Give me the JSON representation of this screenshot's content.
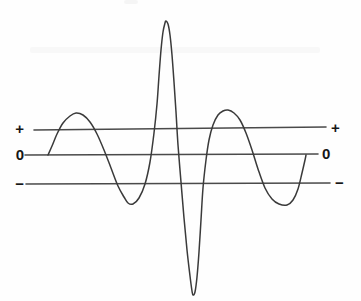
{
  "figure": {
    "background_color": "#fefefe",
    "curve_color": "#3a3a3a",
    "line_color": "#4a4a4a",
    "label_color": "#161616"
  },
  "labels": {
    "left": {
      "plus": "+",
      "zero": "0",
      "minus": "−"
    },
    "right": {
      "plus": "+",
      "zero": "0",
      "minus": "−"
    }
  },
  "reference_lines": [
    {
      "name": "plus-level-line",
      "label": "+",
      "x1": 34,
      "y1": 130,
      "x2": 326,
      "y2": 127
    },
    {
      "name": "zero-level-line",
      "label": "0",
      "x1": 25,
      "y1": 155,
      "x2": 318,
      "y2": 154
    },
    {
      "name": "minus-level-line",
      "label": "−",
      "x1": 26,
      "y1": 184,
      "x2": 330,
      "y2": 183
    }
  ],
  "chart_data": {
    "type": "line",
    "xlabel": "",
    "ylabel": "",
    "grid": false,
    "legend": null,
    "axis_levels": [
      "+",
      "0",
      "−"
    ],
    "level_y_pixels": {
      "plus": 128,
      "zero": 155,
      "minus": 183
    },
    "xlim": [
      48,
      306
    ],
    "ylim_pixels": [
      21,
      295
    ],
    "annotations": [
      "Curve begins at the zero level on the left at x=48",
      "Curve ends at the zero level on the right at x=306",
      "Central feature is a tall narrow positive spike immediately followed by a deep negative spike"
    ],
    "features": [
      {
        "name": "start",
        "x": 48,
        "y": 155,
        "level": "0"
      },
      {
        "name": "hump-1-peak",
        "x": 76,
        "y": 113,
        "level": "above +"
      },
      {
        "name": "trough-1-min",
        "x": 128,
        "y": 203,
        "level": "below −"
      },
      {
        "name": "spike-up-apex",
        "x": 166,
        "y": 21,
        "level": "far above +"
      },
      {
        "name": "spike-down-min",
        "x": 193,
        "y": 295,
        "level": "far below −"
      },
      {
        "name": "hump-2-peak",
        "x": 228,
        "y": 110,
        "level": "above +"
      },
      {
        "name": "trough-2-min",
        "x": 287,
        "y": 205,
        "level": "below −"
      },
      {
        "name": "end",
        "x": 306,
        "y": 155,
        "level": "0"
      }
    ],
    "points": [
      [
        48,
        155
      ],
      [
        52,
        146
      ],
      [
        57,
        134
      ],
      [
        63,
        123
      ],
      [
        70,
        116
      ],
      [
        76,
        113
      ],
      [
        83,
        115
      ],
      [
        90,
        122
      ],
      [
        97,
        134
      ],
      [
        104,
        150
      ],
      [
        111,
        168
      ],
      [
        118,
        186
      ],
      [
        124,
        197
      ],
      [
        128,
        203
      ],
      [
        133,
        204
      ],
      [
        139,
        198
      ],
      [
        145,
        184
      ],
      [
        150,
        162
      ],
      [
        154,
        133
      ],
      [
        157,
        104
      ],
      [
        159,
        76
      ],
      [
        161,
        50
      ],
      [
        163,
        32
      ],
      [
        165,
        23
      ],
      [
        166,
        21
      ],
      [
        168,
        24
      ],
      [
        170,
        35
      ],
      [
        172,
        55
      ],
      [
        174,
        82
      ],
      [
        176,
        112
      ],
      [
        178,
        145
      ],
      [
        181,
        182
      ],
      [
        184,
        218
      ],
      [
        187,
        250
      ],
      [
        190,
        276
      ],
      [
        192,
        291
      ],
      [
        193,
        295
      ],
      [
        195,
        292
      ],
      [
        197,
        277
      ],
      [
        199,
        252
      ],
      [
        201,
        220
      ],
      [
        203,
        188
      ],
      [
        206,
        160
      ],
      [
        209,
        140
      ],
      [
        213,
        125
      ],
      [
        218,
        115
      ],
      [
        223,
        111
      ],
      [
        228,
        110
      ],
      [
        234,
        113
      ],
      [
        240,
        120
      ],
      [
        246,
        133
      ],
      [
        252,
        150
      ],
      [
        258,
        169
      ],
      [
        265,
        188
      ],
      [
        272,
        199
      ],
      [
        279,
        204
      ],
      [
        287,
        205
      ],
      [
        293,
        200
      ],
      [
        298,
        189
      ],
      [
        302,
        173
      ],
      [
        305,
        160
      ],
      [
        306,
        155
      ]
    ]
  },
  "label_positions": {
    "left_plus": {
      "x": 12,
      "y": 121
    },
    "left_zero": {
      "x": 12,
      "y": 147
    },
    "left_minus": {
      "x": 12,
      "y": 176
    },
    "right_plus": {
      "x": 332,
      "y": 120
    },
    "right_zero": {
      "x": 324,
      "y": 146
    },
    "right_minus": {
      "x": 336,
      "y": 175
    }
  }
}
